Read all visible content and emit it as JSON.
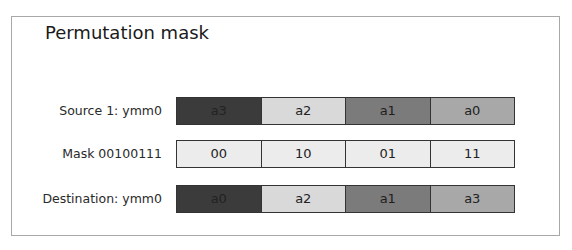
{
  "title": "Permutation mask",
  "rows": [
    {
      "label": "Source 1: ymm0",
      "cells": [
        {
          "text": "a3",
          "shade": "dark"
        },
        {
          "text": "a2",
          "shade": "light"
        },
        {
          "text": "a1",
          "shade": "mid"
        },
        {
          "text": "a0",
          "shade": "gray"
        }
      ]
    },
    {
      "label": "Mask 00100111",
      "cells": [
        {
          "text": "00",
          "shade": "mask"
        },
        {
          "text": "10",
          "shade": "mask"
        },
        {
          "text": "01",
          "shade": "mask"
        },
        {
          "text": "11",
          "shade": "mask"
        }
      ]
    },
    {
      "label": "Destination: ymm0",
      "cells": [
        {
          "text": "a0",
          "shade": "dark"
        },
        {
          "text": "a2",
          "shade": "light"
        },
        {
          "text": "a1",
          "shade": "mid"
        },
        {
          "text": "a3",
          "shade": "gray"
        }
      ]
    }
  ],
  "colors": {
    "dark": "#3b3b3b",
    "light": "#d9d9d9",
    "mid": "#7b7b7b",
    "gray": "#a8a8a8",
    "mask": "#ececec",
    "frame": "#a8a8a8"
  }
}
